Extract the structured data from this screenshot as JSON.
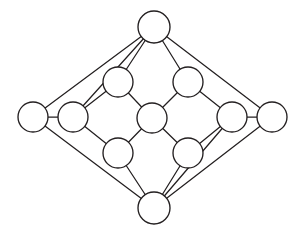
{
  "figure": {
    "background_color": "#ffffff",
    "line_color": "#231f20",
    "node_fill_color": "#ffffff",
    "canvas": {
      "width": 302,
      "height": 227
    }
  },
  "chart_data": {
    "type": "diagram",
    "subtype": "node-link-graph",
    "title": "",
    "xlabel": "",
    "ylabel": "",
    "grid": false,
    "legend": false,
    "node_count": 12,
    "edge_count": 20,
    "node_radius": 15,
    "nodes": [
      {
        "id": "top",
        "label": "",
        "x": 154,
        "y": 27,
        "r": 16,
        "degree": 4
      },
      {
        "id": "left-outer",
        "label": "",
        "x": 33,
        "y": 117,
        "r": 15,
        "degree": 3
      },
      {
        "id": "left-inner",
        "label": "",
        "x": 73,
        "y": 117,
        "r": 15,
        "degree": 4
      },
      {
        "id": "upper-left",
        "label": "",
        "x": 118,
        "y": 82,
        "r": 15,
        "degree": 3
      },
      {
        "id": "upper-right",
        "label": "",
        "x": 188,
        "y": 82,
        "r": 15,
        "degree": 3
      },
      {
        "id": "center",
        "label": "",
        "x": 152,
        "y": 118,
        "r": 15,
        "degree": 4
      },
      {
        "id": "lower-left",
        "label": "",
        "x": 118,
        "y": 153,
        "r": 15,
        "degree": 3
      },
      {
        "id": "lower-right",
        "label": "",
        "x": 188,
        "y": 153,
        "r": 15,
        "degree": 3
      },
      {
        "id": "right-inner",
        "label": "",
        "x": 232,
        "y": 117,
        "r": 15,
        "degree": 4
      },
      {
        "id": "right-outer",
        "label": "",
        "x": 272,
        "y": 117,
        "r": 15,
        "degree": 3
      },
      {
        "id": "bottom",
        "label": "",
        "x": 154,
        "y": 208,
        "r": 16,
        "degree": 4
      },
      {
        "id": "hidden-dup",
        "label": "",
        "x": 152,
        "y": 118,
        "r": 0,
        "degree": 0
      }
    ],
    "edges": [
      {
        "source": "top",
        "target": "left-outer"
      },
      {
        "source": "top",
        "target": "right-outer"
      },
      {
        "source": "top",
        "target": "upper-left"
      },
      {
        "source": "top",
        "target": "upper-right"
      },
      {
        "source": "left-outer",
        "target": "left-inner"
      },
      {
        "source": "left-outer",
        "target": "bottom"
      },
      {
        "source": "left-inner",
        "target": "upper-left"
      },
      {
        "source": "left-inner",
        "target": "lower-left"
      },
      {
        "source": "left-inner",
        "target": "top"
      },
      {
        "source": "upper-left",
        "target": "center"
      },
      {
        "source": "upper-right",
        "target": "center"
      },
      {
        "source": "upper-right",
        "target": "right-inner"
      },
      {
        "source": "center",
        "target": "lower-left"
      },
      {
        "source": "center",
        "target": "lower-right"
      },
      {
        "source": "lower-left",
        "target": "bottom"
      },
      {
        "source": "lower-right",
        "target": "bottom"
      },
      {
        "source": "lower-right",
        "target": "right-inner"
      },
      {
        "source": "right-inner",
        "target": "right-outer"
      },
      {
        "source": "right-inner",
        "target": "bottom"
      },
      {
        "source": "right-outer",
        "target": "bottom"
      }
    ]
  }
}
